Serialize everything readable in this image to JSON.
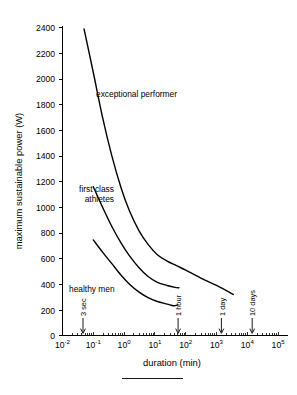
{
  "chart_data": {
    "type": "line",
    "title": "",
    "xlabel": "duration (min)",
    "ylabel": "maximum sustainable power (W)",
    "xscale": "log",
    "yscale": "linear",
    "xlim": [
      0.01,
      100000
    ],
    "ylim": [
      0,
      2400
    ],
    "grid": false,
    "legend_position": "inline-annotations",
    "xticks": [
      {
        "value": 0.01,
        "label": "10",
        "exponent": "-2"
      },
      {
        "value": 0.1,
        "label": "10",
        "exponent": "-1"
      },
      {
        "value": 1,
        "label": "10",
        "exponent": "0"
      },
      {
        "value": 10,
        "label": "10",
        "exponent": "1"
      },
      {
        "value": 100,
        "label": "10",
        "exponent": "2"
      },
      {
        "value": 1000,
        "label": "10",
        "exponent": "3"
      },
      {
        "value": 10000,
        "label": "10",
        "exponent": "4"
      },
      {
        "value": 100000,
        "label": "10",
        "exponent": "5"
      }
    ],
    "yticks": [
      0,
      200,
      400,
      600,
      800,
      1000,
      1200,
      1400,
      1600,
      1800,
      2000,
      2200,
      2400
    ],
    "series": [
      {
        "name": "exceptional performer",
        "label": "exceptional performer",
        "points": [
          {
            "x": 0.05,
            "y": 2390
          },
          {
            "x": 0.1,
            "y": 2050
          },
          {
            "x": 0.2,
            "y": 1700
          },
          {
            "x": 0.4,
            "y": 1400
          },
          {
            "x": 0.8,
            "y": 1150
          },
          {
            "x": 1.5,
            "y": 970
          },
          {
            "x": 3,
            "y": 820
          },
          {
            "x": 6,
            "y": 710
          },
          {
            "x": 12,
            "y": 630
          },
          {
            "x": 25,
            "y": 580
          },
          {
            "x": 50,
            "y": 545
          },
          {
            "x": 100,
            "y": 510
          },
          {
            "x": 300,
            "y": 450
          },
          {
            "x": 1000,
            "y": 390
          },
          {
            "x": 3500,
            "y": 320
          }
        ]
      },
      {
        "name": "first class athletes",
        "label": "first class athletes",
        "points": [
          {
            "x": 0.1,
            "y": 1160
          },
          {
            "x": 0.2,
            "y": 1000
          },
          {
            "x": 0.4,
            "y": 850
          },
          {
            "x": 0.8,
            "y": 720
          },
          {
            "x": 1.5,
            "y": 620
          },
          {
            "x": 3,
            "y": 530
          },
          {
            "x": 6,
            "y": 460
          },
          {
            "x": 12,
            "y": 415
          },
          {
            "x": 25,
            "y": 390
          },
          {
            "x": 45,
            "y": 375
          },
          {
            "x": 60,
            "y": 372
          }
        ]
      },
      {
        "name": "healthy men",
        "label": "healthy men",
        "points": [
          {
            "x": 0.1,
            "y": 745
          },
          {
            "x": 0.2,
            "y": 650
          },
          {
            "x": 0.4,
            "y": 560
          },
          {
            "x": 0.8,
            "y": 470
          },
          {
            "x": 1.5,
            "y": 400
          },
          {
            "x": 3,
            "y": 340
          },
          {
            "x": 6,
            "y": 295
          },
          {
            "x": 12,
            "y": 265
          },
          {
            "x": 25,
            "y": 245
          },
          {
            "x": 40,
            "y": 232
          },
          {
            "x": 55,
            "y": 238
          }
        ]
      }
    ],
    "annotations": [
      {
        "name": "3-sec",
        "label": "3 sec",
        "x": 0.05,
        "orientation": "vertical"
      },
      {
        "name": "1-hour",
        "label": "1 hour",
        "x": 60,
        "orientation": "vertical"
      },
      {
        "name": "1-day",
        "label": "1 day",
        "x": 1440,
        "orientation": "vertical"
      },
      {
        "name": "10-days",
        "label": "10 days",
        "x": 14400,
        "orientation": "vertical"
      }
    ]
  },
  "figure": {
    "caption_rule": true
  }
}
